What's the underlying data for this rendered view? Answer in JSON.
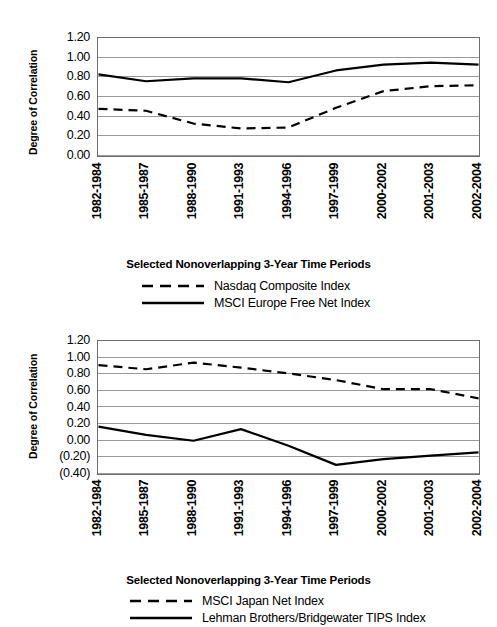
{
  "chart_data": [
    {
      "id": "top",
      "type": "line",
      "title": "",
      "xlabel": "Selected Nonoverlapping 3-Year Time Periods",
      "ylabel": "Degree of Correlation",
      "categories": [
        "1982-1984",
        "1985-1987",
        "1988-1990",
        "1991-1993",
        "1994-1996",
        "1997-1999",
        "2000-2002",
        "2001-2003",
        "2002-2004"
      ],
      "ylim": [
        0.0,
        1.2
      ],
      "ytick_labels": [
        "1.20",
        "1.00",
        "0.80",
        "0.60",
        "0.40",
        "0.20",
        "0.00"
      ],
      "ytick_values": [
        1.2,
        1.0,
        0.8,
        0.6,
        0.4,
        0.2,
        0.0
      ],
      "grid": true,
      "legend_position": "below",
      "series": [
        {
          "name": "Nasdaq Composite Index",
          "style": "dashed",
          "color": "#000000",
          "values": [
            0.48,
            0.46,
            0.33,
            0.28,
            0.29,
            0.49,
            0.66,
            0.71,
            0.72
          ]
        },
        {
          "name": "MSCI Europe Free Net Index",
          "style": "solid",
          "color": "#000000",
          "values": [
            0.83,
            0.76,
            0.79,
            0.79,
            0.75,
            0.87,
            0.93,
            0.95,
            0.93
          ]
        }
      ]
    },
    {
      "id": "bottom",
      "type": "line",
      "title": "",
      "xlabel": "Selected Nonoverlapping 3-Year Time Periods",
      "ylabel": "Degree of Correlation",
      "categories": [
        "1982-1984",
        "1985-1987",
        "1988-1990",
        "1991-1993",
        "1994-1996",
        "1997-1999",
        "2000-2002",
        "2001-2003",
        "2002-2004"
      ],
      "ylim": [
        -0.4,
        1.2
      ],
      "ytick_labels": [
        "1.20",
        "1.00",
        "0.80",
        "0.60",
        "0.40",
        "0.20",
        "0.00",
        "(0.20)",
        "(0.40)"
      ],
      "ytick_values": [
        1.2,
        1.0,
        0.8,
        0.6,
        0.4,
        0.2,
        0.0,
        -0.2,
        -0.4
      ],
      "grid": true,
      "legend_position": "below",
      "series": [
        {
          "name": "MSCI Japan Net Index",
          "style": "dashed",
          "color": "#000000",
          "values": [
            0.91,
            0.86,
            0.94,
            0.88,
            0.81,
            0.73,
            0.62,
            0.62,
            0.51
          ]
        },
        {
          "name": "Lehman Brothers/Bridgewater TIPS Index",
          "style": "solid",
          "color": "#000000",
          "values": [
            0.17,
            0.07,
            0.0,
            0.14,
            -0.06,
            -0.29,
            -0.22,
            -0.18,
            -0.14
          ]
        }
      ]
    }
  ]
}
